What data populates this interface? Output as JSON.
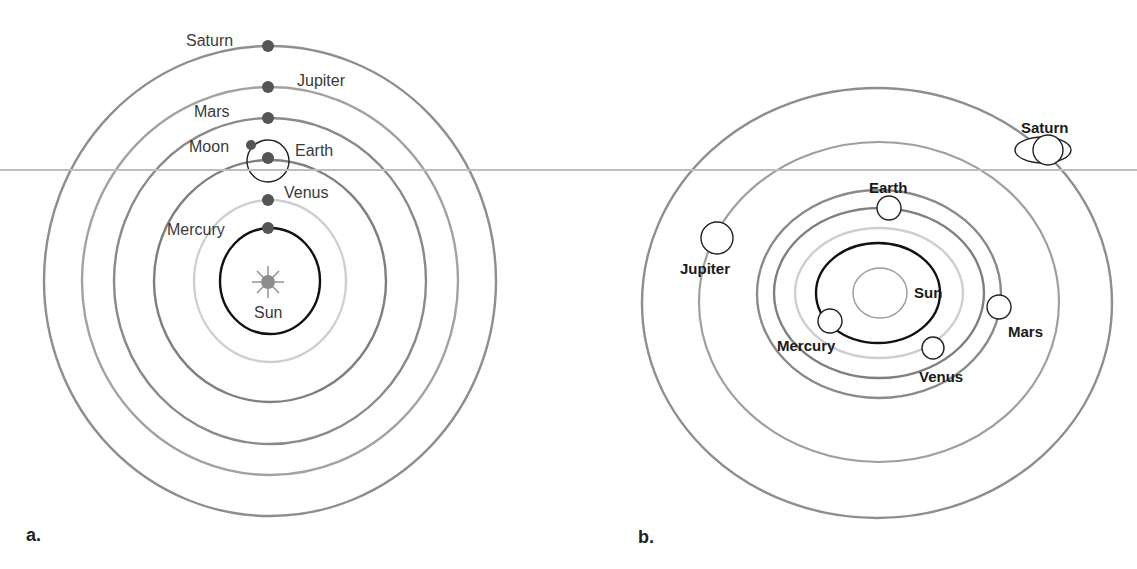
{
  "colors": {
    "orbit_dark": "#8a8a8a",
    "orbit_mid": "#9a9a9a",
    "orbit_light": "#c9c9c9",
    "orbit_black": "#111111",
    "planet_dot": "#555555",
    "sun_a": "#8c8c8c",
    "divider": "#bdbdbd"
  },
  "diagram_a": {
    "panel_label": "a.",
    "model": "geocentric",
    "labels": {
      "saturn": "Saturn",
      "jupiter": "Jupiter",
      "mars": "Mars",
      "moon": "Moon",
      "earth": "Earth",
      "venus": "Venus",
      "mercury": "Mercury",
      "sun": "Sun"
    }
  },
  "diagram_b": {
    "panel_label": "b.",
    "model": "heliocentric",
    "labels": {
      "saturn": "Saturn",
      "earth": "Earth",
      "jupiter": "Jupiter",
      "sun": "Sun",
      "mars": "Mars",
      "mercury": "Mercury",
      "venus": "Venus"
    }
  }
}
